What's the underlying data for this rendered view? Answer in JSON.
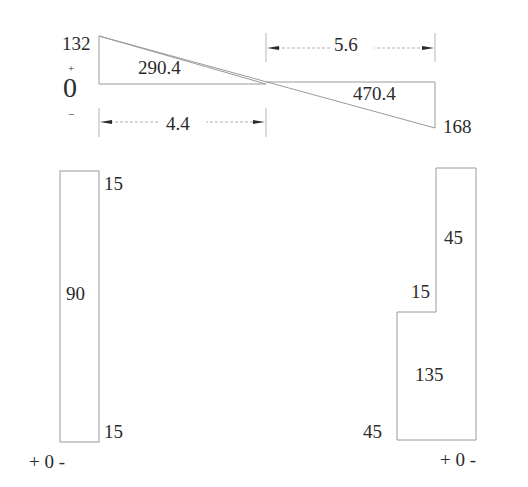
{
  "moment_diagram": {
    "left_value": "132",
    "right_value": "168",
    "left_area": "290.4",
    "right_area": "470.4",
    "sign_plus": "+",
    "sign_zero": "0",
    "sign_minus": "−",
    "dim_left": "4.4",
    "dim_right": "5.6"
  },
  "left_column": {
    "top_value": "15",
    "mid_value": "90",
    "bottom_value": "15",
    "axis_label": "+ 0 -"
  },
  "right_column": {
    "upper_value": "45",
    "step_value": "15",
    "lower_value": "135",
    "bottom_value": "45",
    "axis_label": "+ 0 -"
  }
}
